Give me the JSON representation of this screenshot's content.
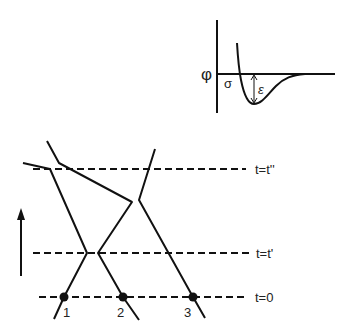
{
  "potential_plot": {
    "y_label": "φ",
    "sigma_label": "σ",
    "epsilon_label": "ε"
  },
  "trajectory_diagram": {
    "time_labels": {
      "t0": "t=0",
      "t1": "t=t'",
      "t2": "t=t''"
    },
    "particles": [
      {
        "id": 1,
        "label": "1"
      },
      {
        "id": 2,
        "label": "2"
      },
      {
        "id": 3,
        "label": "3"
      }
    ],
    "time_arrow": "increasing time"
  }
}
